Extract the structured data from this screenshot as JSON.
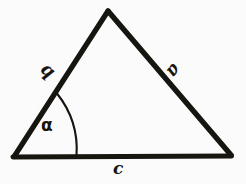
{
  "figure": {
    "background_color": "#fbfbfb",
    "stroke_color": "#17150f",
    "labels": {
      "side_a": "a",
      "side_b": "b",
      "side_c": "c",
      "angle_alpha": "α"
    },
    "geometry": {
      "apex": [
        108,
        11
      ],
      "bottom_left": [
        14,
        157
      ],
      "bottom_right": [
        231,
        156
      ],
      "arc_start_on_side_b": [
        57,
        94
      ],
      "arc_end_on_side_c": [
        76,
        156
      ],
      "stroke_width_px": 5,
      "arc_stroke_width_px": 2
    }
  }
}
